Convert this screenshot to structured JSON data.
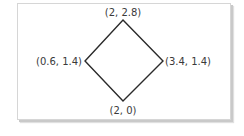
{
  "diagram": {
    "shape": "diamond",
    "stroke_color": "#2a2a2a",
    "frame_border_color": "#d6d6d6",
    "vertices": [
      {
        "name": "top",
        "label": "(2, 2.8)",
        "x": 2,
        "y": 2.8
      },
      {
        "name": "left",
        "label": "(0.6, 1.4)",
        "x": 0.6,
        "y": 1.4
      },
      {
        "name": "right",
        "label": "(3.4, 1.4)",
        "x": 3.4,
        "y": 1.4
      },
      {
        "name": "bottom",
        "label": "(2, 0)",
        "x": 2,
        "y": 0
      }
    ]
  }
}
